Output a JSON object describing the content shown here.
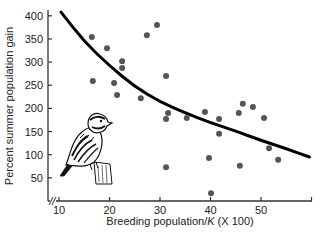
{
  "chart_data": {
    "type": "scatter",
    "title": "",
    "xlabel": "Breeding population/K (X 100)",
    "xlabel_plain": "Breeding population/",
    "xlabel_italic": "K",
    "xlabel_suffix": " (X 100)",
    "ylabel": "Percent summer population gain",
    "xlim": [
      8,
      60
    ],
    "ylim": [
      0,
      420
    ],
    "x_ticks": [
      10,
      20,
      30,
      40,
      50
    ],
    "y_ticks": [
      50,
      100,
      150,
      200,
      250,
      300,
      350,
      400
    ],
    "axis_break": "x-axis break near origin",
    "grid": false,
    "legend": null,
    "series": [
      {
        "name": "observations",
        "type": "scatter",
        "color": "#555555",
        "points": [
          {
            "x": 16.5,
            "y": 354
          },
          {
            "x": 16.7,
            "y": 259
          },
          {
            "x": 19.5,
            "y": 330
          },
          {
            "x": 20.9,
            "y": 255
          },
          {
            "x": 21.5,
            "y": 229
          },
          {
            "x": 22.5,
            "y": 302
          },
          {
            "x": 22.5,
            "y": 287
          },
          {
            "x": 26.2,
            "y": 222
          },
          {
            "x": 27.4,
            "y": 358
          },
          {
            "x": 29.4,
            "y": 380
          },
          {
            "x": 31.2,
            "y": 270
          },
          {
            "x": 31.6,
            "y": 190
          },
          {
            "x": 31.2,
            "y": 177
          },
          {
            "x": 31.2,
            "y": 73
          },
          {
            "x": 35.3,
            "y": 179
          },
          {
            "x": 38.9,
            "y": 192
          },
          {
            "x": 39.7,
            "y": 93
          },
          {
            "x": 40.1,
            "y": 17
          },
          {
            "x": 41.7,
            "y": 177
          },
          {
            "x": 41.7,
            "y": 145
          },
          {
            "x": 45.6,
            "y": 190
          },
          {
            "x": 45.8,
            "y": 76
          },
          {
            "x": 46.4,
            "y": 210
          },
          {
            "x": 48.4,
            "y": 203
          },
          {
            "x": 50.6,
            "y": 179
          },
          {
            "x": 51.6,
            "y": 114
          },
          {
            "x": 53.4,
            "y": 89
          }
        ]
      },
      {
        "name": "fitted curve",
        "type": "line",
        "color": "#000000",
        "points": [
          {
            "x": 10.4,
            "y": 408
          },
          {
            "x": 15,
            "y": 344
          },
          {
            "x": 20,
            "y": 292
          },
          {
            "x": 25,
            "y": 247
          },
          {
            "x": 30,
            "y": 214
          },
          {
            "x": 35,
            "y": 190
          },
          {
            "x": 40,
            "y": 169
          },
          {
            "x": 45,
            "y": 151
          },
          {
            "x": 50,
            "y": 131
          },
          {
            "x": 55,
            "y": 113
          },
          {
            "x": 59.6,
            "y": 95
          }
        ]
      }
    ],
    "annotations": [
      "Illustration of a quail (bobwhite) perched on a post"
    ]
  }
}
